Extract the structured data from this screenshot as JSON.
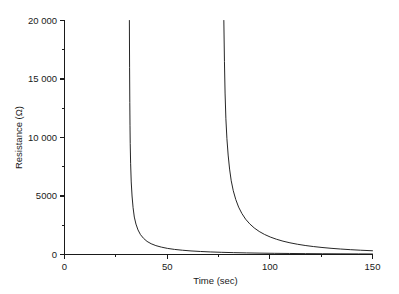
{
  "chart_data": {
    "type": "line",
    "title": "",
    "xlabel": "Time (sec)",
    "ylabel": "Resistance (Ω)",
    "xlim": [
      0,
      150
    ],
    "ylim": [
      0,
      20000
    ],
    "grid": false,
    "legend": "none",
    "x_ticks_major": [
      0,
      50,
      100,
      150
    ],
    "x_tick_labels": [
      "0",
      "50",
      "100",
      "150"
    ],
    "x_ticks_minor": [
      25,
      75,
      125
    ],
    "y_ticks_major": [
      0,
      5000,
      10000,
      15000,
      20000
    ],
    "y_tick_labels": [
      "0",
      "5000",
      "10 000",
      "15 000",
      "20 000"
    ],
    "y_ticks_minor": [
      2500,
      7500,
      12500,
      17500
    ],
    "series": [
      {
        "name": "first-transition",
        "asymptote_time": 32,
        "points": [
          [
            31.6,
            20000
          ],
          [
            31.7,
            16000
          ],
          [
            31.8,
            13000
          ],
          [
            31.9,
            11000
          ],
          [
            32.0,
            9500
          ],
          [
            32.2,
            7800
          ],
          [
            32.5,
            6200
          ],
          [
            32.9,
            5000
          ],
          [
            33.4,
            4000
          ],
          [
            34.0,
            3200
          ],
          [
            34.8,
            2600
          ],
          [
            35.8,
            2100
          ],
          [
            37.0,
            1700
          ],
          [
            38.5,
            1380
          ],
          [
            40.2,
            1120
          ],
          [
            42.2,
            920
          ],
          [
            44.5,
            760
          ],
          [
            47.2,
            630
          ],
          [
            50.2,
            520
          ],
          [
            53.6,
            435
          ],
          [
            57.4,
            365
          ],
          [
            61.6,
            305
          ],
          [
            66.2,
            258
          ],
          [
            71.2,
            218
          ],
          [
            76.6,
            186
          ],
          [
            82.4,
            158
          ],
          [
            88.6,
            136
          ],
          [
            95.2,
            117
          ],
          [
            102.2,
            101
          ],
          [
            109.6,
            88
          ],
          [
            117.4,
            76
          ],
          [
            125.6,
            66
          ],
          [
            134.2,
            58
          ],
          [
            143.2,
            50
          ],
          [
            150.0,
            45
          ]
        ]
      },
      {
        "name": "second-transition",
        "asymptote_time": 78,
        "points": [
          [
            77.6,
            20000
          ],
          [
            77.9,
            16500
          ],
          [
            78.2,
            13800
          ],
          [
            78.6,
            11600
          ],
          [
            79.1,
            9900
          ],
          [
            79.7,
            8500
          ],
          [
            80.4,
            7300
          ],
          [
            81.2,
            6300
          ],
          [
            82.2,
            5450
          ],
          [
            83.4,
            4700
          ],
          [
            84.8,
            4050
          ],
          [
            86.4,
            3500
          ],
          [
            88.2,
            3020
          ],
          [
            90.2,
            2620
          ],
          [
            92.4,
            2270
          ],
          [
            94.8,
            1970
          ],
          [
            97.4,
            1715
          ],
          [
            100.2,
            1495
          ],
          [
            103.2,
            1305
          ],
          [
            106.4,
            1140
          ],
          [
            109.8,
            1000
          ],
          [
            113.4,
            878
          ],
          [
            117.2,
            772
          ],
          [
            121.2,
            680
          ],
          [
            125.4,
            600
          ],
          [
            129.8,
            530
          ],
          [
            134.4,
            468
          ],
          [
            139.2,
            414
          ],
          [
            144.2,
            366
          ],
          [
            150.0,
            320
          ]
        ]
      }
    ]
  }
}
